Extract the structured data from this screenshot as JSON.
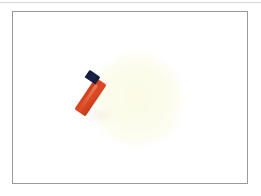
{
  "image": {
    "kind": "photograph",
    "subject": "red-orange lighter-like object with dark navy cap on a white background",
    "canvas": {
      "width_px": 261,
      "height_px": 196,
      "background_color": "#ffffff"
    },
    "frame": {
      "present": true,
      "border_color": "#9a9a9e",
      "border_width_px": 1,
      "left_px": 12,
      "top_px": 11,
      "width_px": 236,
      "height_px": 173,
      "fill_color": "#ffffff"
    },
    "top_rule": {
      "present": true,
      "color": "#c9c9c9",
      "top_px": 2,
      "height_px": 1
    },
    "elements": [
      {
        "name": "glow",
        "description": "faint pale yellow circular glow",
        "color": "#fbfbe6",
        "center_x_px": 133,
        "center_y_px": 99,
        "radius_px": 46
      },
      {
        "name": "object-body",
        "description": "red-orange rectangular body of the lighter",
        "color": "#d2421f",
        "highlight_color": "#ffaa8c",
        "rotation_deg": 34
      },
      {
        "name": "object-cap",
        "description": "dark navy near-black cap at the upper end",
        "color": "#1b2348",
        "rotation_deg": 34
      },
      {
        "name": "fragment",
        "description": "small detached red piece below and left of the main object",
        "color": "#da4722",
        "rotation_deg": 22
      }
    ],
    "palette": {
      "red_orange": "#d2421f",
      "red_orange_dark": "#b5371a",
      "navy_cap": "#1b2348",
      "pale_yellow_glow": "#fbfbe6",
      "frame_gray": "#9a9a9e",
      "background_white": "#ffffff"
    }
  }
}
